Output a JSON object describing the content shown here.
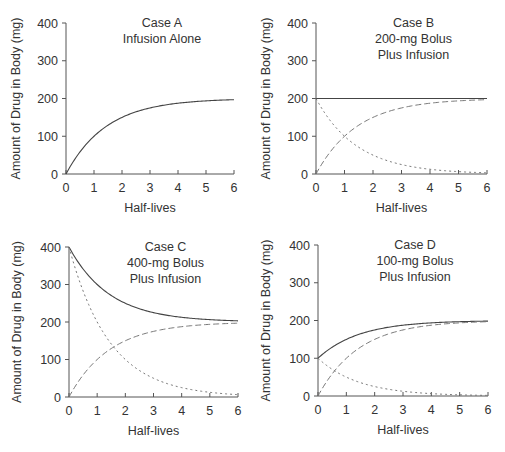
{
  "figure": {
    "x_axis_label": "Half-lives",
    "y_axis_label": "Amount of Drug in Body (mg)"
  },
  "chart_data": [
    {
      "id": "A",
      "type": "line",
      "title": "Case A",
      "subtitle_lines": [
        "Infusion Alone"
      ],
      "xlabel": "Half-lives",
      "ylabel": "Amount of Drug in Body (mg)",
      "xlim": [
        0,
        6
      ],
      "ylim": [
        0,
        400
      ],
      "x_ticks": [
        0,
        1,
        2,
        3,
        4,
        5,
        6
      ],
      "y_ticks": [
        0,
        100,
        200,
        300,
        400
      ],
      "grid": false,
      "bolus_mg": 0,
      "plateau_mg": 200,
      "x": [
        0,
        0.5,
        1,
        1.5,
        2,
        2.5,
        3,
        3.5,
        4,
        4.5,
        5,
        5.5,
        6
      ],
      "series": [
        {
          "name": "Total (infusion alone)",
          "style": "solid",
          "values": [
            0,
            58.6,
            100,
            129.3,
            150,
            164.6,
            175,
            182.3,
            187.5,
            191.2,
            193.8,
            195.6,
            196.9
          ]
        }
      ]
    },
    {
      "id": "B",
      "type": "line",
      "title": "Case B",
      "subtitle_lines": [
        "200-mg Bolus",
        "Plus Infusion"
      ],
      "xlabel": "Half-lives",
      "ylabel": "Amount of Drug in Body (mg)",
      "xlim": [
        0,
        6
      ],
      "ylim": [
        0,
        400
      ],
      "x_ticks": [
        0,
        1,
        2,
        3,
        4,
        5,
        6
      ],
      "y_ticks": [
        0,
        100,
        200,
        300,
        400
      ],
      "grid": false,
      "bolus_mg": 200,
      "plateau_mg": 200,
      "x": [
        0,
        0.5,
        1,
        1.5,
        2,
        2.5,
        3,
        3.5,
        4,
        4.5,
        5,
        5.5,
        6
      ],
      "series": [
        {
          "name": "Total",
          "style": "solid",
          "values": [
            200,
            200,
            200,
            200,
            200,
            200,
            200,
            200,
            200,
            200,
            200,
            200,
            200
          ]
        },
        {
          "name": "Infusion",
          "style": "dashed",
          "values": [
            0,
            58.6,
            100,
            129.3,
            150,
            164.6,
            175,
            182.3,
            187.5,
            191.2,
            193.8,
            195.6,
            196.9
          ]
        },
        {
          "name": "Bolus",
          "style": "dotted",
          "values": [
            200,
            141.4,
            100,
            70.7,
            50,
            35.4,
            25,
            17.7,
            12.5,
            8.8,
            6.3,
            4.4,
            3.1
          ]
        }
      ]
    },
    {
      "id": "C",
      "type": "line",
      "title": "Case C",
      "subtitle_lines": [
        "400-mg Bolus",
        "Plus Infusion"
      ],
      "xlabel": "Half-lives",
      "ylabel": "Amount of Drug in Body (mg)",
      "xlim": [
        0,
        6
      ],
      "ylim": [
        0,
        400
      ],
      "x_ticks": [
        0,
        1,
        2,
        3,
        4,
        5,
        6
      ],
      "y_ticks": [
        0,
        100,
        200,
        300,
        400
      ],
      "grid": false,
      "bolus_mg": 400,
      "plateau_mg": 200,
      "x": [
        0,
        0.5,
        1,
        1.5,
        2,
        2.5,
        3,
        3.5,
        4,
        4.5,
        5,
        5.5,
        6
      ],
      "series": [
        {
          "name": "Total",
          "style": "solid",
          "values": [
            400,
            341.4,
            300,
            270.7,
            250,
            235.4,
            225,
            217.7,
            212.5,
            208.8,
            206.3,
            204.4,
            203.1
          ]
        },
        {
          "name": "Infusion",
          "style": "dashed",
          "values": [
            0,
            58.6,
            100,
            129.3,
            150,
            164.6,
            175,
            182.3,
            187.5,
            191.2,
            193.8,
            195.6,
            196.9
          ]
        },
        {
          "name": "Bolus",
          "style": "dotted",
          "values": [
            400,
            282.8,
            200,
            141.4,
            100,
            70.7,
            50,
            35.4,
            25,
            17.7,
            12.5,
            8.8,
            6.3
          ]
        }
      ]
    },
    {
      "id": "D",
      "type": "line",
      "title": "Case D",
      "subtitle_lines": [
        "100-mg Bolus",
        "Plus Infusion"
      ],
      "xlabel": "Half-lives",
      "ylabel": "Amount of Drug in Body (mg)",
      "xlim": [
        0,
        6
      ],
      "ylim": [
        0,
        400
      ],
      "x_ticks": [
        0,
        1,
        2,
        3,
        4,
        5,
        6
      ],
      "y_ticks": [
        0,
        100,
        200,
        300,
        400
      ],
      "grid": false,
      "bolus_mg": 100,
      "plateau_mg": 200,
      "x": [
        0,
        0.5,
        1,
        1.5,
        2,
        2.5,
        3,
        3.5,
        4,
        4.5,
        5,
        5.5,
        6
      ],
      "series": [
        {
          "name": "Total",
          "style": "solid",
          "values": [
            100,
            129.3,
            150,
            164.6,
            175,
            182.3,
            187.5,
            191.2,
            193.8,
            195.6,
            196.9,
            197.8,
            198.4
          ]
        },
        {
          "name": "Infusion",
          "style": "dashed",
          "values": [
            0,
            58.6,
            100,
            129.3,
            150,
            164.6,
            175,
            182.3,
            187.5,
            191.2,
            193.8,
            195.6,
            196.9
          ]
        },
        {
          "name": "Bolus",
          "style": "dotted",
          "values": [
            100,
            70.7,
            50,
            35.4,
            25,
            17.7,
            12.5,
            8.8,
            6.3,
            4.4,
            3.1,
            2.2,
            1.6
          ]
        }
      ]
    }
  ]
}
